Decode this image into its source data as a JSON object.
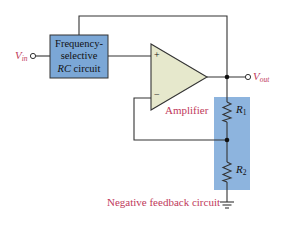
{
  "diagram": {
    "input_label": {
      "main": "V",
      "sub": "in"
    },
    "output_label": {
      "main": "V",
      "sub": "out"
    },
    "rc_block": {
      "line1": "Frequency-",
      "line2": "selective",
      "line3_italic": "RC",
      "line3_rest": " circuit"
    },
    "amplifier": {
      "label": "Amplifier",
      "plus": "+",
      "minus": "−"
    },
    "resistors": [
      {
        "main": "R",
        "sub": "1"
      },
      {
        "main": "R",
        "sub": "2"
      }
    ],
    "feedback_label": "Negative feedback circuit",
    "colors": {
      "block_fill": "#7ba7d6",
      "feedback_fill": "#8db4de",
      "amp_fill": "#e6e8cc",
      "wire": "#333333",
      "label_red": "#c0395a"
    }
  }
}
